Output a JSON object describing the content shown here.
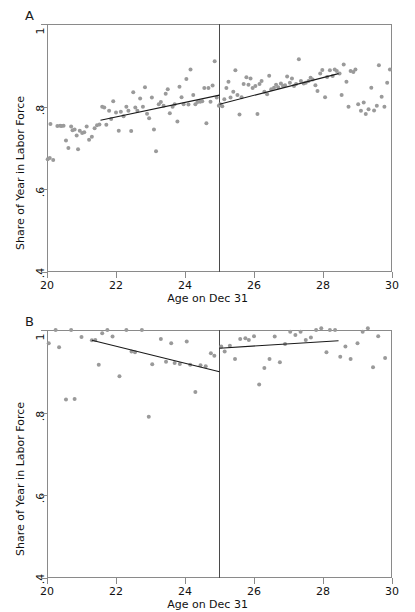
{
  "figure": {
    "panels": [
      {
        "letter": "A",
        "ylabel": "Share of Year in Labor Force",
        "xlabel": "Age on Dec 31",
        "yticks": [
          "1",
          ".8",
          ".6",
          ".4"
        ],
        "xticks": [
          "20",
          "22",
          "24",
          "26",
          "28",
          "30"
        ]
      },
      {
        "letter": "B",
        "ylabel": "Share of Year in Labor Force",
        "xlabel": "Age on Dec 31",
        "yticks": [
          "1",
          ".8",
          ".6",
          ".4"
        ],
        "xticks": [
          "20",
          "22",
          "24",
          "26",
          "28",
          "30"
        ]
      }
    ]
  },
  "chart_data": [
    {
      "type": "scatter",
      "panel": "A",
      "title": "",
      "xlabel": "Age on Dec 31",
      "ylabel": "Share of Year in Labor Force",
      "xlim": [
        20,
        30
      ],
      "ylim": [
        0.4,
        1.0
      ],
      "xticks": [
        20,
        22,
        24,
        26,
        28,
        30
      ],
      "yticks": [
        0.4,
        0.6,
        0.8,
        1.0
      ],
      "grid": false,
      "legend": null,
      "cutoff": {
        "x": 25,
        "label": "Age 25 discontinuity"
      },
      "marker_color": "#9a9a9a",
      "line_color": "#1a1a1a",
      "points": [
        [
          20.02,
          0.673
        ],
        [
          20.08,
          0.676
        ],
        [
          20.1,
          0.758
        ],
        [
          20.18,
          0.671
        ],
        [
          20.3,
          0.753
        ],
        [
          20.38,
          0.754
        ],
        [
          20.42,
          0.753
        ],
        [
          20.48,
          0.754
        ],
        [
          20.55,
          0.718
        ],
        [
          20.62,
          0.7
        ],
        [
          20.7,
          0.752
        ],
        [
          20.74,
          0.743
        ],
        [
          20.8,
          0.745
        ],
        [
          20.86,
          0.73
        ],
        [
          20.9,
          0.697
        ],
        [
          20.95,
          0.742
        ],
        [
          21.02,
          0.736
        ],
        [
          21.08,
          0.738
        ],
        [
          21.15,
          0.752
        ],
        [
          21.22,
          0.72
        ],
        [
          21.3,
          0.727
        ],
        [
          21.38,
          0.748
        ],
        [
          21.45,
          0.755
        ],
        [
          21.52,
          0.757
        ],
        [
          21.6,
          0.8
        ],
        [
          21.66,
          0.798
        ],
        [
          21.72,
          0.756
        ],
        [
          21.8,
          0.79
        ],
        [
          21.86,
          0.77
        ],
        [
          21.92,
          0.813
        ],
        [
          22.0,
          0.786
        ],
        [
          22.08,
          0.742
        ],
        [
          22.14,
          0.788
        ],
        [
          22.22,
          0.777
        ],
        [
          22.3,
          0.8
        ],
        [
          22.36,
          0.79
        ],
        [
          22.44,
          0.741
        ],
        [
          22.5,
          0.835
        ],
        [
          22.56,
          0.798
        ],
        [
          22.62,
          0.79
        ],
        [
          22.7,
          0.82
        ],
        [
          22.78,
          0.8
        ],
        [
          22.84,
          0.847
        ],
        [
          22.9,
          0.783
        ],
        [
          22.96,
          0.772
        ],
        [
          23.04,
          0.822
        ],
        [
          23.1,
          0.745
        ],
        [
          23.16,
          0.692
        ],
        [
          23.24,
          0.806
        ],
        [
          23.3,
          0.811
        ],
        [
          23.38,
          0.802
        ],
        [
          23.44,
          0.831
        ],
        [
          23.5,
          0.842
        ],
        [
          23.56,
          0.784
        ],
        [
          23.64,
          0.8
        ],
        [
          23.7,
          0.806
        ],
        [
          23.78,
          0.764
        ],
        [
          23.84,
          0.848
        ],
        [
          23.9,
          0.823
        ],
        [
          23.96,
          0.806
        ],
        [
          24.04,
          0.867
        ],
        [
          24.1,
          0.805
        ],
        [
          24.16,
          0.89
        ],
        [
          24.24,
          0.828
        ],
        [
          24.3,
          0.806
        ],
        [
          24.36,
          0.811
        ],
        [
          24.44,
          0.812
        ],
        [
          24.5,
          0.813
        ],
        [
          24.56,
          0.845
        ],
        [
          24.62,
          0.76
        ],
        [
          24.68,
          0.845
        ],
        [
          24.74,
          0.812
        ],
        [
          24.8,
          0.851
        ],
        [
          24.86,
          0.91
        ],
        [
          24.92,
          0.822
        ],
        [
          24.98,
          0.802
        ],
        [
          25.02,
          0.806
        ],
        [
          25.08,
          0.801
        ],
        [
          25.14,
          0.818
        ],
        [
          25.2,
          0.845
        ],
        [
          25.26,
          0.86
        ],
        [
          25.32,
          0.822
        ],
        [
          25.4,
          0.836
        ],
        [
          25.46,
          0.888
        ],
        [
          25.52,
          0.828
        ],
        [
          25.58,
          0.781
        ],
        [
          25.64,
          0.823
        ],
        [
          25.7,
          0.855
        ],
        [
          25.78,
          0.871
        ],
        [
          25.84,
          0.853
        ],
        [
          25.9,
          0.868
        ],
        [
          25.96,
          0.845
        ],
        [
          26.04,
          0.85
        ],
        [
          26.1,
          0.782
        ],
        [
          26.16,
          0.855
        ],
        [
          26.22,
          0.862
        ],
        [
          26.3,
          0.836
        ],
        [
          26.38,
          0.83
        ],
        [
          26.44,
          0.875
        ],
        [
          26.5,
          0.842
        ],
        [
          26.58,
          0.846
        ],
        [
          26.64,
          0.853
        ],
        [
          26.7,
          0.847
        ],
        [
          26.78,
          0.856
        ],
        [
          26.84,
          0.85
        ],
        [
          26.9,
          0.852
        ],
        [
          26.96,
          0.873
        ],
        [
          27.04,
          0.858
        ],
        [
          27.1,
          0.868
        ],
        [
          27.16,
          0.85
        ],
        [
          27.22,
          0.855
        ],
        [
          27.3,
          0.915
        ],
        [
          27.36,
          0.862
        ],
        [
          27.44,
          0.856
        ],
        [
          27.5,
          0.858
        ],
        [
          27.58,
          0.862
        ],
        [
          27.64,
          0.87
        ],
        [
          27.7,
          0.866
        ],
        [
          27.78,
          0.852
        ],
        [
          27.84,
          0.838
        ],
        [
          27.92,
          0.88
        ],
        [
          27.98,
          0.889
        ],
        [
          28.06,
          0.823
        ],
        [
          28.12,
          0.872
        ],
        [
          28.2,
          0.888
        ],
        [
          28.28,
          0.874
        ],
        [
          28.34,
          0.89
        ],
        [
          28.4,
          0.886
        ],
        [
          28.48,
          0.88
        ],
        [
          28.54,
          0.828
        ],
        [
          28.6,
          0.902
        ],
        [
          28.68,
          0.86
        ],
        [
          28.74,
          0.8
        ],
        [
          28.8,
          0.886
        ],
        [
          28.88,
          0.884
        ],
        [
          28.94,
          0.89
        ],
        [
          29.02,
          0.806
        ],
        [
          29.1,
          0.79
        ],
        [
          29.18,
          0.81
        ],
        [
          29.24,
          0.782
        ],
        [
          29.32,
          0.794
        ],
        [
          29.4,
          0.846
        ],
        [
          29.48,
          0.791
        ],
        [
          29.56,
          0.802
        ],
        [
          29.62,
          0.9
        ],
        [
          29.7,
          0.824
        ],
        [
          29.78,
          0.8
        ],
        [
          29.86,
          0.858
        ],
        [
          29.94,
          0.89
        ]
      ],
      "fit_left": {
        "x": [
          21.55,
          25.0
        ],
        "y": [
          0.767,
          0.828
        ]
      },
      "fit_right": {
        "x": [
          25.0,
          28.45
        ],
        "y": [
          0.806,
          0.88
        ]
      }
    },
    {
      "type": "scatter",
      "panel": "B",
      "title": "",
      "xlabel": "Age on Dec 31",
      "ylabel": "Share of Year in Labor Force",
      "xlim": [
        20,
        30
      ],
      "ylim": [
        0.4,
        1.0
      ],
      "xticks": [
        20,
        22,
        24,
        26,
        28,
        30
      ],
      "yticks": [
        0.4,
        0.6,
        0.8,
        1.0
      ],
      "grid": false,
      "legend": null,
      "cutoff": {
        "x": 25,
        "label": "Age 25 discontinuity"
      },
      "marker_color": "#9a9a9a",
      "line_color": "#1a1a1a",
      "points": [
        [
          20.05,
          0.968
        ],
        [
          20.25,
          1.0
        ],
        [
          20.35,
          0.958
        ],
        [
          20.55,
          0.832
        ],
        [
          20.7,
          1.0
        ],
        [
          20.8,
          0.833
        ],
        [
          21.0,
          0.983
        ],
        [
          21.3,
          0.975
        ],
        [
          21.4,
          0.976
        ],
        [
          21.5,
          0.916
        ],
        [
          21.6,
          0.992
        ],
        [
          21.75,
          1.0
        ],
        [
          21.9,
          0.984
        ],
        [
          22.1,
          0.888
        ],
        [
          22.3,
          1.0
        ],
        [
          22.45,
          0.948
        ],
        [
          22.55,
          0.946
        ],
        [
          22.75,
          1.0
        ],
        [
          22.95,
          0.79
        ],
        [
          23.05,
          0.917
        ],
        [
          23.3,
          0.978
        ],
        [
          23.45,
          0.923
        ],
        [
          23.6,
          0.968
        ],
        [
          23.7,
          0.92
        ],
        [
          23.85,
          0.918
        ],
        [
          24.05,
          0.972
        ],
        [
          24.15,
          0.916
        ],
        [
          24.3,
          0.85
        ],
        [
          24.45,
          0.915
        ],
        [
          24.6,
          0.912
        ],
        [
          24.75,
          0.944
        ],
        [
          24.85,
          0.938
        ],
        [
          25.05,
          0.96
        ],
        [
          25.15,
          0.948
        ],
        [
          25.3,
          0.962
        ],
        [
          25.45,
          0.93
        ],
        [
          25.6,
          0.978
        ],
        [
          25.75,
          0.98
        ],
        [
          25.85,
          0.976
        ],
        [
          26.0,
          0.985
        ],
        [
          26.15,
          0.868
        ],
        [
          26.3,
          0.908
        ],
        [
          26.45,
          0.93
        ],
        [
          26.6,
          0.984
        ],
        [
          26.75,
          0.922
        ],
        [
          26.9,
          0.966
        ],
        [
          27.05,
          0.996
        ],
        [
          27.2,
          0.988
        ],
        [
          27.35,
          0.996
        ],
        [
          27.5,
          0.976
        ],
        [
          27.65,
          0.982
        ],
        [
          27.8,
          1.0
        ],
        [
          27.95,
          1.004
        ],
        [
          28.1,
          0.946
        ],
        [
          28.2,
          1.0
        ],
        [
          28.35,
          1.0
        ],
        [
          28.5,
          0.935
        ],
        [
          28.65,
          0.96
        ],
        [
          28.8,
          0.93
        ],
        [
          29.0,
          0.968
        ],
        [
          29.15,
          0.996
        ],
        [
          29.3,
          1.004
        ],
        [
          29.45,
          0.91
        ],
        [
          29.6,
          0.985
        ],
        [
          29.8,
          0.932
        ]
      ],
      "fit_left": {
        "x": [
          21.3,
          25.0
        ],
        "y": [
          0.975,
          0.899
        ]
      },
      "fit_right": {
        "x": [
          25.0,
          28.45
        ],
        "y": [
          0.956,
          0.974
        ]
      }
    }
  ]
}
